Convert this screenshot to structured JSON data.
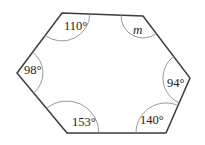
{
  "figure": {
    "type": "polygon-angle-diagram",
    "shape_name": "hexagon",
    "sides": 6,
    "stroke_color": "#3c3c3c",
    "arc_color": "#8c8c8c",
    "fill_color": "#ffffff",
    "text_color": "#1c1c1c",
    "background": "#ffffff",
    "vertices": [
      {
        "id": "top-left",
        "x": 62,
        "y": 13
      },
      {
        "id": "top-right",
        "x": 143,
        "y": 16
      },
      {
        "id": "right",
        "x": 190,
        "y": 78
      },
      {
        "id": "bottom-right",
        "x": 166,
        "y": 133
      },
      {
        "id": "bottom-left",
        "x": 67,
        "y": 133
      },
      {
        "id": "left",
        "x": 17,
        "y": 73
      }
    ],
    "angles": [
      {
        "id": "angle-top-left",
        "label": "110°",
        "value": 110,
        "unit": "degrees",
        "is_unknown": false,
        "vertex": "top-left",
        "label_x": 64,
        "label_y": 20,
        "arc_radius": 28
      },
      {
        "id": "angle-top-right",
        "label": "m",
        "value": null,
        "unit": "degrees",
        "is_unknown": true,
        "vertex": "top-right",
        "label_x": 133,
        "label_y": 23,
        "arc_radius": 22
      },
      {
        "id": "angle-right",
        "label": "94°",
        "value": 94,
        "unit": "degrees",
        "is_unknown": false,
        "vertex": "right",
        "label_x": 167,
        "label_y": 77,
        "arc_radius": 27
      },
      {
        "id": "angle-bottom-right",
        "label": "140°",
        "value": 140,
        "unit": "degrees",
        "is_unknown": false,
        "vertex": "bottom-right",
        "label_x": 140,
        "label_y": 114,
        "arc_radius": 30
      },
      {
        "id": "angle-bottom-left",
        "label": "153°",
        "value": 153,
        "unit": "degrees",
        "is_unknown": false,
        "vertex": "bottom-left",
        "label_x": 72,
        "label_y": 116,
        "arc_radius": 32
      },
      {
        "id": "angle-left",
        "label": "98°",
        "value": 98,
        "unit": "degrees",
        "is_unknown": false,
        "vertex": "left",
        "label_x": 24,
        "label_y": 64,
        "arc_radius": 26
      }
    ]
  }
}
